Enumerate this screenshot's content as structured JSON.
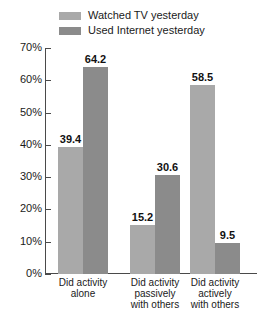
{
  "chart_data": {
    "type": "bar",
    "title": "",
    "xlabel": "",
    "ylabel": "",
    "ylim": [
      0,
      70
    ],
    "grid": false,
    "legend_position": "top",
    "ytick_labels": [
      "70%",
      "60%",
      "50%",
      "40%",
      "30%",
      "20%",
      "10%",
      "0%"
    ],
    "ytick_values": [
      70,
      60,
      50,
      40,
      30,
      20,
      10,
      0
    ],
    "categories": [
      "Did activity alone",
      "Did activity passively with others",
      "Did activity actively with others"
    ],
    "category_lines": [
      [
        "Did activity",
        "alone"
      ],
      [
        "Did activity",
        "passively",
        "with others"
      ],
      [
        "Did activity",
        "actively",
        "with others"
      ]
    ],
    "series": [
      {
        "name": "Watched TV yesterday",
        "color": "#a9a9a9",
        "values": [
          39.4,
          15.2,
          58.5
        ],
        "labels": [
          "39.4",
          "15.2",
          "58.5"
        ]
      },
      {
        "name": "Used Internet yesterday",
        "color": "#8b8b8b",
        "values": [
          64.2,
          30.6,
          9.5
        ],
        "labels": [
          "64.2",
          "30.6",
          "9.5"
        ]
      }
    ]
  },
  "legend": {
    "items": [
      {
        "label": "Watched TV yesterday",
        "color": "#a9a9a9"
      },
      {
        "label": "Used Internet yesterday",
        "color": "#8b8b8b"
      }
    ]
  },
  "axis": {
    "line_color": "#4a4a4a"
  }
}
